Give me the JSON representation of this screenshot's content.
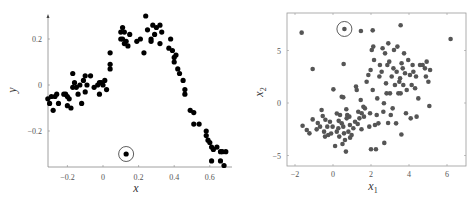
{
  "chart_data": [
    {
      "type": "scatter",
      "title": "",
      "xlabel": "x",
      "ylabel": "y",
      "xlim": [
        -0.31,
        0.7
      ],
      "ylim": [
        -0.36,
        0.33
      ],
      "xticks": [
        -0.2,
        0,
        0.2,
        0.4,
        0.6
      ],
      "xtick_labels": [
        "−0.2",
        "0",
        "0.2",
        "0.4",
        "0.6"
      ],
      "yticks": [
        -0.2,
        0,
        0.2
      ],
      "ytick_labels": [
        "−0.2",
        "0",
        "0.2"
      ],
      "grid": false,
      "frame": "left-bottom axes with arrow",
      "point_color": "#000000",
      "highlighted_point": {
        "x": 0.13,
        "y": -0.3,
        "annotation": "circled"
      },
      "points": [
        [
          -0.31,
          -0.06
        ],
        [
          -0.3,
          -0.08
        ],
        [
          -0.29,
          -0.05
        ],
        [
          -0.28,
          -0.11
        ],
        [
          -0.27,
          -0.05
        ],
        [
          -0.26,
          -0.04
        ],
        [
          -0.25,
          -0.08
        ],
        [
          -0.22,
          -0.04
        ],
        [
          -0.21,
          -0.04
        ],
        [
          -0.2,
          -0.05
        ],
        [
          -0.19,
          -0.06
        ],
        [
          -0.2,
          -0.09
        ],
        [
          -0.18,
          -0.1
        ],
        [
          -0.17,
          0.05
        ],
        [
          -0.17,
          -0.01
        ],
        [
          -0.16,
          0.01
        ],
        [
          -0.15,
          -0.01
        ],
        [
          -0.14,
          -0.04
        ],
        [
          -0.13,
          0.0
        ],
        [
          -0.12,
          -0.08
        ],
        [
          -0.11,
          0.02
        ],
        [
          -0.1,
          -0.03
        ],
        [
          -0.1,
          0.04
        ],
        [
          -0.09,
          0.0
        ],
        [
          -0.07,
          0.04
        ],
        [
          -0.05,
          -0.01
        ],
        [
          -0.03,
          0.0
        ],
        [
          -0.02,
          -0.04
        ],
        [
          -0.02,
          0.01
        ],
        [
          -0.01,
          0.01
        ],
        [
          0.0,
          0.0
        ],
        [
          0.01,
          0.02
        ],
        [
          0.02,
          -0.02
        ],
        [
          0.04,
          0.14
        ],
        [
          0.04,
          0.09
        ],
        [
          0.04,
          0.07
        ],
        [
          0.1,
          0.2
        ],
        [
          0.1,
          0.23
        ],
        [
          0.11,
          0.25
        ],
        [
          0.11,
          0.2
        ],
        [
          0.12,
          0.23
        ],
        [
          0.12,
          0.18
        ],
        [
          0.13,
          0.19
        ],
        [
          0.14,
          0.17
        ],
        [
          0.15,
          0.22
        ],
        [
          0.19,
          0.19
        ],
        [
          0.21,
          0.2
        ],
        [
          0.24,
          0.3
        ],
        [
          0.23,
          0.14
        ],
        [
          0.25,
          0.24
        ],
        [
          0.27,
          0.2
        ],
        [
          0.27,
          0.19
        ],
        [
          0.28,
          0.26
        ],
        [
          0.29,
          0.22
        ],
        [
          0.3,
          0.25
        ],
        [
          0.32,
          0.18
        ],
        [
          0.32,
          0.26
        ],
        [
          0.33,
          0.23
        ],
        [
          0.37,
          0.16
        ],
        [
          0.38,
          0.2
        ],
        [
          0.39,
          0.15
        ],
        [
          0.4,
          0.1
        ],
        [
          0.41,
          0.13
        ],
        [
          0.4,
          0.12
        ],
        [
          0.42,
          0.07
        ],
        [
          0.43,
          0.05
        ],
        [
          0.45,
          0.02
        ],
        [
          0.46,
          -0.04
        ],
        [
          0.46,
          -0.02
        ],
        [
          0.49,
          -0.11
        ],
        [
          0.51,
          -0.12
        ],
        [
          0.51,
          -0.17
        ],
        [
          0.54,
          -0.17
        ],
        [
          0.58,
          -0.2
        ],
        [
          0.58,
          -0.22
        ],
        [
          0.59,
          -0.24
        ],
        [
          0.6,
          -0.25
        ],
        [
          0.61,
          -0.27
        ],
        [
          0.61,
          -0.33
        ],
        [
          0.62,
          -0.28
        ],
        [
          0.64,
          -0.27
        ],
        [
          0.66,
          -0.29
        ],
        [
          0.67,
          -0.29
        ],
        [
          0.69,
          -0.29
        ],
        [
          0.66,
          -0.33
        ],
        [
          0.68,
          -0.35
        ]
      ]
    },
    {
      "type": "scatter",
      "title": "",
      "xlabel": "x1",
      "ylabel": "x2",
      "xlim": [
        -2.5,
        7
      ],
      "ylim": [
        -6,
        8.5
      ],
      "xticks": [
        -2,
        0,
        2,
        4,
        6
      ],
      "xtick_labels": [
        "−2",
        "0",
        "2",
        "4",
        "6"
      ],
      "yticks": [
        -5,
        0,
        5
      ],
      "ytick_labels": [
        "−5",
        "0",
        "5"
      ],
      "grid": false,
      "frame": "full box",
      "point_color": "#555555",
      "highlighted_point": {
        "x": 0.6,
        "y": 7.05,
        "annotation": "circled"
      },
      "points": [
        [
          -1.65,
          6.7
        ],
        [
          -1.07,
          3.24
        ],
        [
          1.47,
          6.86
        ],
        [
          2.09,
          6.92
        ],
        [
          3.56,
          7.4
        ],
        [
          6.19,
          6.1
        ],
        [
          0.56,
          3.71
        ],
        [
          0.02,
          1.3
        ],
        [
          -1.6,
          -2.16
        ],
        [
          -1.38,
          -2.57
        ],
        [
          -1.24,
          -2.89
        ],
        [
          -1.07,
          -1.56
        ],
        [
          -0.86,
          -2.51
        ],
        [
          -0.68,
          -2.25
        ],
        [
          -0.6,
          -0.67
        ],
        [
          -0.54,
          -1.24
        ],
        [
          -0.47,
          -2.73
        ],
        [
          -0.42,
          -3.2
        ],
        [
          -0.3,
          -2.25
        ],
        [
          -0.25,
          -3.05
        ],
        [
          -0.16,
          -1.78
        ],
        [
          -0.02,
          -2.25
        ],
        [
          0.11,
          -4.1
        ],
        [
          0.2,
          -2.73
        ],
        [
          0.28,
          -2.41
        ],
        [
          0.33,
          -3.2
        ],
        [
          0.37,
          -1.14
        ],
        [
          0.46,
          0.6
        ],
        [
          0.54,
          0.54
        ],
        [
          0.46,
          -1.94
        ],
        [
          0.54,
          -2.25
        ],
        [
          0.58,
          -2.89
        ],
        [
          0.63,
          -3.52
        ],
        [
          0.68,
          -4.63
        ],
        [
          0.72,
          -1.46
        ],
        [
          0.75,
          -1.14
        ],
        [
          0.81,
          -2.73
        ],
        [
          0.86,
          -1.3
        ],
        [
          0.89,
          -2.1
        ],
        [
          0.98,
          -3.05
        ],
        [
          1.07,
          -2.41
        ],
        [
          1.16,
          -1.78
        ],
        [
          1.21,
          1.56
        ],
        [
          1.25,
          1.24
        ],
        [
          1.33,
          -0.83
        ],
        [
          1.39,
          -1.46
        ],
        [
          1.46,
          0.29
        ],
        [
          1.51,
          -0.98
        ],
        [
          1.6,
          -0.35
        ],
        [
          1.63,
          -1.3
        ],
        [
          1.68,
          -0.51
        ],
        [
          1.77,
          2.03
        ],
        [
          1.86,
          2.67
        ],
        [
          1.91,
          -2.25
        ],
        [
          1.95,
          -0.98
        ],
        [
          1.98,
          3.14
        ],
        [
          2.04,
          5.05
        ],
        [
          2.09,
          1.24
        ],
        [
          2.12,
          5.37
        ],
        [
          2.16,
          4.1
        ],
        [
          2.21,
          -2.1
        ],
        [
          2.26,
          -4.41
        ],
        [
          2.3,
          -1.14
        ],
        [
          2.33,
          0.44
        ],
        [
          2.39,
          -1.94
        ],
        [
          2.44,
          2.52
        ],
        [
          2.47,
          3.62
        ],
        [
          2.56,
          2.98
        ],
        [
          2.61,
          5.21
        ],
        [
          2.65,
          -0.83
        ],
        [
          2.68,
          -0.03
        ],
        [
          2.74,
          4.73
        ],
        [
          2.79,
          1.87
        ],
        [
          2.82,
          0.92
        ],
        [
          2.86,
          3.62
        ],
        [
          2.91,
          5.68
        ],
        [
          2.96,
          3.94
        ],
        [
          3.0,
          0.92
        ],
        [
          3.04,
          -1.14
        ],
        [
          3.09,
          2.52
        ],
        [
          3.14,
          -0.51
        ],
        [
          3.18,
          3.3
        ],
        [
          3.21,
          5.05
        ],
        [
          3.26,
          1.71
        ],
        [
          3.32,
          -1.94
        ],
        [
          3.35,
          2.98
        ],
        [
          3.39,
          5.37
        ],
        [
          3.44,
          0.92
        ],
        [
          3.49,
          2.03
        ],
        [
          3.53,
          2.35
        ],
        [
          3.56,
          0.92
        ],
        [
          3.61,
          3.78
        ],
        [
          3.67,
          3.3
        ],
        [
          3.7,
          1.71
        ],
        [
          3.74,
          4.73
        ],
        [
          3.79,
          2.83
        ],
        [
          3.84,
          -0.98
        ],
        [
          3.88,
          1.24
        ],
        [
          3.96,
          4.1
        ],
        [
          4.05,
          2.67
        ],
        [
          4.09,
          -1.46
        ],
        [
          4.14,
          1.71
        ],
        [
          4.19,
          3.62
        ],
        [
          4.23,
          2.98
        ],
        [
          4.32,
          1.4
        ],
        [
          4.37,
          2.52
        ],
        [
          4.4,
          -1.3
        ],
        [
          4.49,
          0.44
        ],
        [
          4.58,
          3.62
        ],
        [
          4.72,
          3.62
        ],
        [
          4.84,
          3.3
        ],
        [
          4.89,
          2.52
        ],
        [
          4.93,
          3.94
        ],
        [
          5.02,
          2.03
        ],
        [
          5.11,
          3.14
        ],
        [
          5.07,
          -0.29
        ],
        [
          -0.4,
          -1.6
        ],
        [
          -0.1,
          -2.9
        ],
        [
          0.3,
          -1.7
        ],
        [
          0.5,
          -3.9
        ],
        [
          0.9,
          -3.3
        ],
        [
          0.2,
          -1.0
        ],
        [
          -0.8,
          -1.9
        ],
        [
          1.3,
          -2.0
        ],
        [
          0.7,
          -0.6
        ],
        [
          1.5,
          -2.5
        ],
        [
          2.9,
          -1.9
        ],
        [
          2.0,
          -4.4
        ],
        [
          3.6,
          -3.0
        ],
        [
          2.7,
          -3.8
        ]
      ]
    }
  ],
  "left_plot": {
    "xlabel": "x",
    "ylabel": "y"
  },
  "right_plot": {
    "xlabel_main": "x",
    "xlabel_sub": "1",
    "ylabel_main": "x",
    "ylabel_sub": "2"
  }
}
